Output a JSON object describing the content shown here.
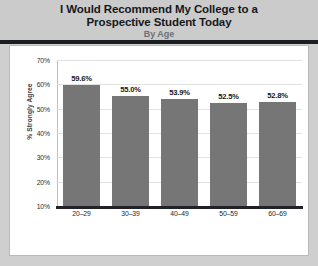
{
  "header": {
    "title_line1": "I Would Recommend My College to a",
    "title_line2": "Prospective Student Today",
    "subtitle": "By Age",
    "background": "#cbcbcb",
    "rule_color": "#1a1d21"
  },
  "chart_data": {
    "type": "bar",
    "title": "I Would Recommend My College to a Prospective Student Today",
    "subtitle": "By Age",
    "xlabel": "",
    "ylabel": "% Strongly Agree",
    "categories": [
      "20–29",
      "30–39",
      "40–49",
      "50–59",
      "60–69"
    ],
    "values": [
      59.6,
      55.0,
      53.9,
      52.5,
      52.8
    ],
    "data_labels": [
      "59.6%",
      "55.0%",
      "53.9%",
      "52.5%",
      "52.8%"
    ],
    "ylim": [
      10,
      70
    ],
    "ytick_values": [
      10,
      20,
      30,
      40,
      50,
      60,
      70
    ],
    "ytick_labels": [
      "10%",
      "20%",
      "30%",
      "40%",
      "50%",
      "60%",
      "70%"
    ],
    "grid": true,
    "legend": false,
    "bar_color": "#767676",
    "grid_color": "#e2e2e2",
    "axis_color": "#1f2226"
  }
}
